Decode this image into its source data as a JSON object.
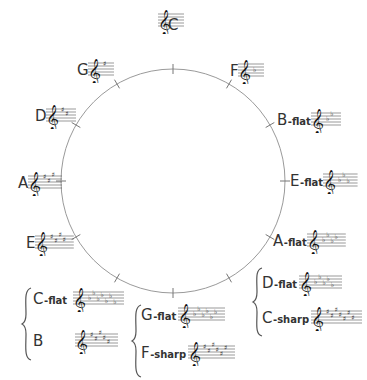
{
  "circle": {
    "cx": 173,
    "cy": 181,
    "r": 112,
    "stroke": "#8a8a8a",
    "tick_count": 12
  },
  "keys": [
    {
      "id": "c",
      "name": "C",
      "suffix": "",
      "accidental": "none",
      "count": 0
    },
    {
      "id": "g",
      "name": "G",
      "suffix": "",
      "accidental": "sharp",
      "count": 1
    },
    {
      "id": "d",
      "name": "D",
      "suffix": "",
      "accidental": "sharp",
      "count": 2
    },
    {
      "id": "a",
      "name": "A",
      "suffix": "",
      "accidental": "sharp",
      "count": 3
    },
    {
      "id": "e",
      "name": "E",
      "suffix": "",
      "accidental": "sharp",
      "count": 4
    },
    {
      "id": "b",
      "name": "B",
      "suffix": "",
      "accidental": "sharp",
      "count": 5
    },
    {
      "id": "cb",
      "name": "C",
      "suffix": "-flat",
      "accidental": "flat",
      "count": 7
    },
    {
      "id": "fs",
      "name": "F",
      "suffix": "-sharp",
      "accidental": "sharp",
      "count": 6
    },
    {
      "id": "gb",
      "name": "G",
      "suffix": "-flat",
      "accidental": "flat",
      "count": 6
    },
    {
      "id": "cs",
      "name": "C",
      "suffix": "-sharp",
      "accidental": "sharp",
      "count": 7
    },
    {
      "id": "db",
      "name": "D",
      "suffix": "-flat",
      "accidental": "flat",
      "count": 5
    },
    {
      "id": "ab",
      "name": "A",
      "suffix": "-flat",
      "accidental": "flat",
      "count": 4
    },
    {
      "id": "eb",
      "name": "E",
      "suffix": "-flat",
      "accidental": "flat",
      "count": 3
    },
    {
      "id": "bb",
      "name": "B",
      "suffix": "-flat",
      "accidental": "flat",
      "count": 2
    },
    {
      "id": "f",
      "name": "F",
      "suffix": "",
      "accidental": "flat",
      "count": 1
    }
  ],
  "enharmonic_pairs": [
    [
      "C-flat",
      "B"
    ],
    [
      "G-flat",
      "F-sharp"
    ],
    [
      "D-flat",
      "C-sharp"
    ]
  ]
}
